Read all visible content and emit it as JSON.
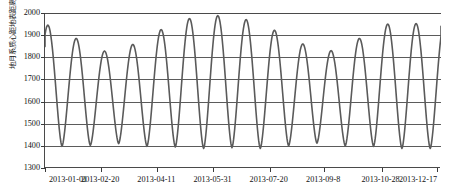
{
  "chart_data": {
    "type": "line",
    "title": "",
    "subtitle": "",
    "xlabel": "",
    "ylabel": "地月系质心距地表距离(BE)/km",
    "ylim": [
      1300,
      2000
    ],
    "ytick_values": [
      2000,
      1900,
      1800,
      1700,
      1600,
      1500,
      1400,
      1300
    ],
    "ytick_labels": [
      "2000",
      "1900",
      "1800",
      "1700",
      "1600",
      "1500",
      "1400",
      "1300"
    ],
    "xtick_labels": [
      "2013-01-01",
      "2013-02-20",
      "2013-04-11",
      "2013-05-31",
      "2013-07-20",
      "2013-09-8",
      "2013-10-28",
      "2013-12-17"
    ],
    "xtick_positions_frac": [
      0.0,
      0.1418,
      0.2836,
      0.4255,
      0.5673,
      0.705,
      0.85,
      0.99
    ],
    "grid": true,
    "grid_axis": "y",
    "legend": false,
    "legend_position": "none",
    "line_color": "#5a5a5a",
    "line_width": 1.6,
    "x_start_label": "2013-01-01",
    "x_end_label": "2013-12-31",
    "series": [
      {
        "name": "地月距离",
        "description": "Oscillating perigee-apogee cycle, approximately 27.5 day period over one year",
        "peaks": [
          1945,
          1885,
          1828,
          1858,
          1925,
          1975,
          1988,
          1970,
          1922,
          1860,
          1830,
          1885,
          1950,
          1952
        ],
        "troughs": [
          1398,
          1402,
          1410,
          1398,
          1395,
          1388,
          1392,
          1388,
          1400,
          1412,
          1400,
          1398,
          1388
        ],
        "start_value": 1530,
        "period_days": 27.5,
        "min_value": 1388,
        "max_value": 1988
      }
    ]
  }
}
